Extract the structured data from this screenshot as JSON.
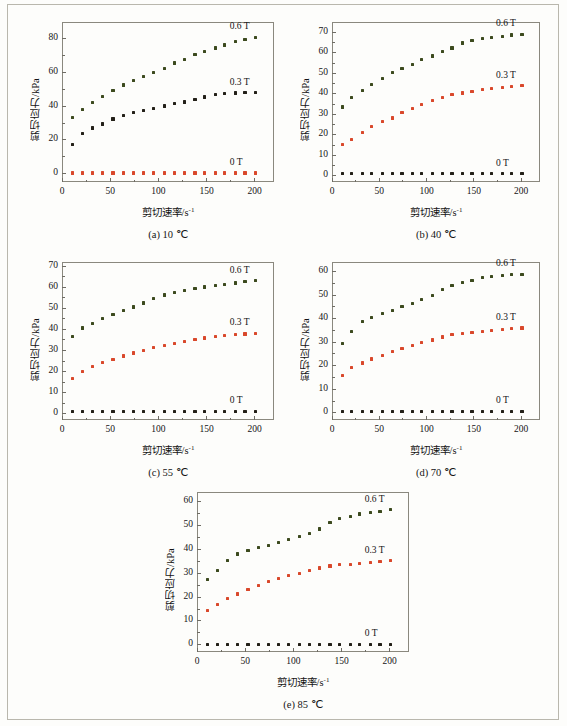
{
  "figure": {
    "axis_titles": {
      "y": "剪切应力/kPa",
      "x_main": "剪切速率/s",
      "x_sup": "-1"
    },
    "series_labels": {
      "high": "0.6 T",
      "mid": "0.3 T",
      "zero": "0 T"
    },
    "colors": {
      "high": "#3c4a1e",
      "mid_red": "#d9482b",
      "mid_dark": "#232018",
      "zero_red": "#d9482b",
      "zero_dark": "#232018",
      "axis": "#8a887e",
      "text": "#141414",
      "page_border": "#b9b7ad",
      "background": "#fdfdfb"
    }
  },
  "chart_data": [
    {
      "type": "scatter",
      "panel": "a",
      "title": "(a) 10 ℃",
      "temperature": "10 ℃",
      "xlabel": "剪切速率/s-1",
      "ylabel": "剪切应力/kPa",
      "xlim": [
        0,
        220
      ],
      "ylim": [
        -5,
        90
      ],
      "xticks": [
        0,
        50,
        100,
        150,
        200
      ],
      "yticks": [
        0,
        20,
        40,
        60,
        80
      ],
      "grid": false,
      "legend_position": "inline-right",
      "x": [
        11,
        21,
        32,
        42,
        53,
        64,
        74,
        85,
        95,
        106,
        117,
        127,
        138,
        148,
        159,
        169,
        180,
        190,
        201
      ],
      "series": [
        {
          "name": "0.6 T",
          "color": "#3c4a1e",
          "values": [
            33.4,
            38.1,
            42.0,
            45.7,
            49.2,
            52.6,
            55.5,
            57.5,
            59.8,
            62.3,
            65.6,
            67.8,
            70.5,
            72.4,
            74.6,
            76.3,
            78.2,
            79.6,
            80.9
          ]
        },
        {
          "name": "0.3 T",
          "color": "#232018",
          "values": [
            17.5,
            23.8,
            27.1,
            29.4,
            32.4,
            34.6,
            36.3,
            37.5,
            38.5,
            40.1,
            41.5,
            42.5,
            44.2,
            45.5,
            46.8,
            47.4,
            47.8,
            48.0,
            48.1
          ]
        },
        {
          "name": "0 T",
          "color": "#d9482b",
          "values": [
            0.3,
            0.3,
            0.3,
            0.3,
            0.3,
            0.3,
            0.3,
            0.3,
            0.3,
            0.3,
            0.3,
            0.3,
            0.3,
            0.3,
            0.3,
            0.3,
            0.3,
            0.3,
            0.3
          ]
        }
      ]
    },
    {
      "type": "scatter",
      "panel": "b",
      "title": "(b) 40 ℃",
      "temperature": "40 ℃",
      "xlabel": "剪切速率/s-1",
      "ylabel": "剪切应力/kPa",
      "xlim": [
        0,
        220
      ],
      "ylim": [
        -3,
        75
      ],
      "xticks": [
        0,
        50,
        100,
        150,
        200
      ],
      "yticks": [
        0,
        10,
        20,
        30,
        40,
        50,
        60,
        70
      ],
      "grid": false,
      "legend_position": "inline-right",
      "x": [
        11,
        21,
        32,
        42,
        53,
        64,
        74,
        85,
        95,
        106,
        117,
        127,
        138,
        148,
        159,
        169,
        180,
        190,
        201
      ],
      "series": [
        {
          "name": "0.6 T",
          "color": "#3c4a1e",
          "values": [
            33.6,
            38.2,
            41.7,
            44.6,
            47.5,
            50.3,
            52.3,
            54.4,
            56.8,
            58.4,
            60.5,
            62.3,
            64.8,
            65.8,
            66.8,
            67.6,
            68.0,
            68.7,
            69.1
          ]
        },
        {
          "name": "0.3 T",
          "color": "#d9482b",
          "values": [
            15.1,
            17.9,
            21.2,
            24.1,
            26.4,
            28.2,
            30.7,
            32.8,
            34.6,
            36.8,
            38.1,
            39.6,
            40.4,
            41.3,
            42.2,
            42.6,
            43.0,
            43.4,
            43.9
          ]
        },
        {
          "name": "0 T",
          "color": "#232018",
          "values": [
            1.0,
            1.0,
            1.0,
            1.0,
            1.0,
            1.0,
            1.0,
            1.0,
            1.0,
            1.0,
            1.0,
            1.0,
            1.0,
            1.0,
            1.0,
            1.0,
            1.0,
            1.0,
            1.0
          ]
        }
      ]
    },
    {
      "type": "scatter",
      "panel": "c",
      "title": "(c) 55 ℃",
      "temperature": "55 ℃",
      "xlabel": "剪切速率/s-1",
      "ylabel": "剪切应力/kPa",
      "xlim": [
        0,
        220
      ],
      "ylim": [
        -3,
        72
      ],
      "xticks": [
        0,
        50,
        100,
        150,
        200
      ],
      "yticks": [
        0,
        10,
        20,
        30,
        40,
        50,
        60,
        70
      ],
      "grid": false,
      "legend_position": "inline-right",
      "x": [
        11,
        21,
        32,
        42,
        53,
        64,
        74,
        85,
        95,
        106,
        117,
        127,
        138,
        148,
        159,
        169,
        180,
        190,
        201
      ],
      "series": [
        {
          "name": "0.6 T",
          "color": "#3c4a1e",
          "values": [
            36.6,
            40.7,
            42.9,
            45.0,
            47.0,
            49.0,
            50.6,
            52.5,
            54.7,
            56.3,
            57.6,
            58.5,
            59.5,
            60.1,
            60.7,
            61.5,
            62.0,
            62.6,
            63.1
          ]
        },
        {
          "name": "0.3 T",
          "color": "#d9482b",
          "values": [
            16.6,
            20.1,
            22.5,
            24.2,
            25.9,
            27.4,
            28.8,
            30.1,
            31.4,
            32.5,
            33.5,
            34.4,
            35.1,
            35.9,
            36.5,
            37.0,
            37.4,
            37.8,
            38.1
          ]
        },
        {
          "name": "0 T",
          "color": "#232018",
          "values": [
            1.2,
            1.2,
            1.2,
            1.2,
            1.2,
            1.2,
            1.2,
            1.2,
            1.2,
            1.2,
            1.2,
            1.2,
            1.2,
            1.2,
            1.2,
            1.2,
            1.2,
            1.2,
            1.2
          ]
        }
      ]
    },
    {
      "type": "scatter",
      "panel": "d",
      "title": "(d) 70 ℃",
      "temperature": "70 ℃",
      "xlabel": "剪切速率/s-1",
      "ylabel": "剪切应力/kPa",
      "xlim": [
        0,
        220
      ],
      "ylim": [
        -3,
        64
      ],
      "xticks": [
        0,
        50,
        100,
        150,
        200
      ],
      "yticks": [
        0,
        10,
        20,
        30,
        40,
        50,
        60
      ],
      "grid": false,
      "legend_position": "inline-right",
      "x": [
        11,
        21,
        32,
        42,
        53,
        64,
        74,
        85,
        95,
        106,
        117,
        127,
        138,
        148,
        159,
        169,
        180,
        190,
        201
      ],
      "series": [
        {
          "name": "0.6 T",
          "color": "#3c4a1e",
          "values": [
            29.4,
            34.6,
            38.7,
            40.5,
            42.1,
            43.6,
            45.0,
            46.4,
            48.0,
            49.7,
            52.4,
            54.0,
            55.2,
            56.3,
            57.3,
            57.8,
            58.3,
            58.6,
            58.8
          ]
        },
        {
          "name": "0.3 T",
          "color": "#d9482b",
          "values": [
            16.0,
            19.2,
            21.2,
            22.9,
            24.5,
            25.9,
            27.4,
            28.7,
            29.8,
            30.9,
            32.2,
            33.1,
            33.7,
            34.2,
            34.4,
            34.8,
            35.3,
            35.8,
            36.0
          ]
        },
        {
          "name": "0 T",
          "color": "#232018",
          "values": [
            0.7,
            0.7,
            0.7,
            0.7,
            0.7,
            0.7,
            0.7,
            0.7,
            0.7,
            0.7,
            0.7,
            0.7,
            0.7,
            0.7,
            0.7,
            0.7,
            0.7,
            0.7,
            0.7
          ]
        }
      ]
    },
    {
      "type": "scatter",
      "panel": "e",
      "title": "(e) 85 ℃",
      "temperature": "85 ℃",
      "xlabel": "剪切速率/s-1",
      "ylabel": "剪切应力/kPa",
      "xlim": [
        0,
        220
      ],
      "ylim": [
        -3,
        64
      ],
      "xticks": [
        0,
        50,
        100,
        150,
        200
      ],
      "yticks": [
        0,
        10,
        20,
        30,
        40,
        50,
        60
      ],
      "grid": false,
      "legend_position": "inline-right",
      "x": [
        11,
        21,
        32,
        42,
        53,
        64,
        74,
        85,
        95,
        106,
        117,
        127,
        138,
        148,
        159,
        169,
        180,
        190,
        201
      ],
      "series": [
        {
          "name": "0.6 T",
          "color": "#3c4a1e",
          "values": [
            27.4,
            31.0,
            35.4,
            38.0,
            39.4,
            40.6,
            41.7,
            42.8,
            44.0,
            45.2,
            46.7,
            48.5,
            51.1,
            52.8,
            53.8,
            54.8,
            55.5,
            56.0,
            56.5
          ]
        },
        {
          "name": "0.3 T",
          "color": "#d9482b",
          "values": [
            14.5,
            17.0,
            19.4,
            21.3,
            23.0,
            24.7,
            26.4,
            27.8,
            28.9,
            29.8,
            31.0,
            32.2,
            33.0,
            33.5,
            33.8,
            34.1,
            34.4,
            34.8,
            35.2
          ]
        },
        {
          "name": "0 T",
          "color": "#232018",
          "values": [
            0.2,
            0.2,
            0.2,
            0.2,
            0.2,
            0.2,
            0.2,
            0.2,
            0.2,
            0.2,
            0.2,
            0.2,
            0.2,
            0.2,
            0.2,
            0.2,
            0.2,
            0.2,
            0.2
          ]
        }
      ]
    }
  ]
}
